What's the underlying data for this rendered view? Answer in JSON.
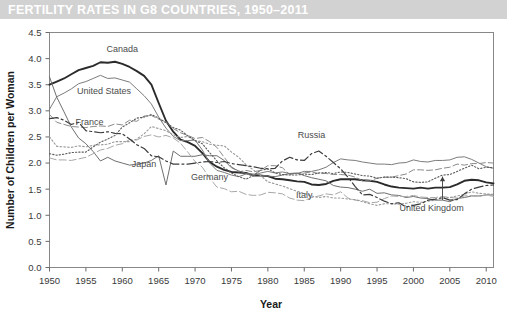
{
  "title": "FERTILITY RATES IN G8 COUNTRIES, 1950–2011",
  "colors": {
    "title_band": "#d2d2d2",
    "title_text": "#ffffff",
    "frame": "#888888",
    "axis_text": "#3a3a3a",
    "label_text": "#4b4b4b"
  },
  "chart_data": {
    "type": "line",
    "title": "FERTILITY RATES IN G8 COUNTRIES, 1950–2011",
    "xlabel": "Year",
    "ylabel": "Number of Children per Woman",
    "xlim": [
      1950,
      2011
    ],
    "ylim": [
      0.0,
      4.5
    ],
    "xticks": [
      1950,
      1955,
      1960,
      1965,
      1970,
      1975,
      1980,
      1985,
      1990,
      1995,
      2000,
      2005,
      2010
    ],
    "yticks": [
      "0.0",
      "0.5",
      "1.0",
      "1.5",
      "2.0",
      "2.5",
      "3.0",
      "3.5",
      "4.0",
      "4.5"
    ],
    "grid": false,
    "legend": "inline-labels",
    "x": [
      1950,
      1951,
      1952,
      1953,
      1954,
      1955,
      1956,
      1957,
      1958,
      1959,
      1960,
      1961,
      1962,
      1963,
      1964,
      1965,
      1966,
      1967,
      1968,
      1969,
      1970,
      1971,
      1972,
      1973,
      1974,
      1975,
      1976,
      1977,
      1978,
      1979,
      1980,
      1981,
      1982,
      1983,
      1984,
      1985,
      1986,
      1987,
      1988,
      1989,
      1990,
      1991,
      1992,
      1993,
      1994,
      1995,
      1996,
      1997,
      1998,
      1999,
      2000,
      2001,
      2002,
      2003,
      2004,
      2005,
      2006,
      2007,
      2008,
      2009,
      2010,
      2011
    ],
    "series": [
      {
        "name": "Canada",
        "label": "Canada",
        "style": "solid-thick-dark",
        "color": "#2b2b2b",
        "width": 1.9,
        "dash": "none",
        "label_xy": [
          1960.0,
          4.12
        ],
        "values": [
          3.5,
          3.56,
          3.62,
          3.7,
          3.78,
          3.82,
          3.86,
          3.93,
          3.92,
          3.94,
          3.9,
          3.84,
          3.76,
          3.67,
          3.5,
          3.15,
          2.81,
          2.6,
          2.45,
          2.4,
          2.33,
          2.19,
          2.02,
          1.93,
          1.87,
          1.83,
          1.82,
          1.81,
          1.76,
          1.76,
          1.75,
          1.7,
          1.69,
          1.67,
          1.65,
          1.64,
          1.59,
          1.58,
          1.6,
          1.66,
          1.69,
          1.69,
          1.69,
          1.67,
          1.66,
          1.64,
          1.59,
          1.55,
          1.53,
          1.52,
          1.51,
          1.53,
          1.51,
          1.53,
          1.53,
          1.54,
          1.59,
          1.66,
          1.68,
          1.67,
          1.63,
          1.61
        ]
      },
      {
        "name": "United States",
        "label": "United States",
        "style": "solid-thin-gray",
        "color": "#7c7c7c",
        "width": 1.0,
        "dash": "none",
        "label_xy": [
          1957.5,
          3.32
        ],
        "values": [
          3.03,
          3.27,
          3.34,
          3.42,
          3.52,
          3.56,
          3.62,
          3.68,
          3.62,
          3.63,
          3.59,
          3.55,
          3.42,
          3.29,
          3.13,
          2.88,
          2.67,
          2.51,
          2.43,
          2.43,
          2.44,
          2.25,
          2.0,
          1.86,
          1.82,
          1.77,
          1.74,
          1.79,
          1.76,
          1.81,
          1.84,
          1.81,
          1.83,
          1.8,
          1.8,
          1.84,
          1.84,
          1.87,
          1.92,
          2.01,
          2.08,
          2.06,
          2.05,
          2.02,
          2.0,
          1.98,
          1.98,
          1.97,
          2.0,
          2.01,
          2.06,
          2.03,
          2.02,
          2.05,
          2.05,
          2.06,
          2.11,
          2.12,
          2.07,
          2.0,
          1.93,
          1.9
        ]
      },
      {
        "name": "France",
        "label": "France",
        "style": "dashed-long-gray",
        "color": "#8a8a8a",
        "width": 1.0,
        "dash": "6,3",
        "label_xy": [
          1955.5,
          2.72
        ],
        "values": [
          2.93,
          2.78,
          2.74,
          2.7,
          2.69,
          2.68,
          2.7,
          2.71,
          2.7,
          2.75,
          2.73,
          2.82,
          2.8,
          2.9,
          2.91,
          2.84,
          2.79,
          2.66,
          2.58,
          2.53,
          2.47,
          2.49,
          2.41,
          2.3,
          2.11,
          1.93,
          1.83,
          1.86,
          1.83,
          1.86,
          1.95,
          1.95,
          1.91,
          1.78,
          1.8,
          1.81,
          1.83,
          1.8,
          1.8,
          1.78,
          1.78,
          1.77,
          1.73,
          1.66,
          1.66,
          1.71,
          1.73,
          1.73,
          1.76,
          1.79,
          1.87,
          1.87,
          1.86,
          1.87,
          1.9,
          1.92,
          1.98,
          1.96,
          1.99,
          1.99,
          2.01,
          2.0
        ]
      },
      {
        "name": "Japan",
        "label": "Japan",
        "style": "solid-thin-gray2",
        "color": "#6f6f6f",
        "width": 1.0,
        "dash": "none",
        "label_xy": [
          1963.0,
          1.92
        ],
        "annotation": "Sharp 1966 dip (Hinoeuma year)",
        "values": [
          3.65,
          3.26,
          2.98,
          2.69,
          2.48,
          2.37,
          2.22,
          2.04,
          2.11,
          2.04,
          2.0,
          1.96,
          1.98,
          2.0,
          2.05,
          2.14,
          1.58,
          2.23,
          2.13,
          2.13,
          2.13,
          2.16,
          2.14,
          2.14,
          2.05,
          1.91,
          1.85,
          1.8,
          1.79,
          1.77,
          1.75,
          1.74,
          1.77,
          1.8,
          1.81,
          1.76,
          1.72,
          1.69,
          1.66,
          1.57,
          1.54,
          1.53,
          1.5,
          1.46,
          1.5,
          1.42,
          1.43,
          1.39,
          1.38,
          1.34,
          1.36,
          1.33,
          1.32,
          1.29,
          1.29,
          1.26,
          1.32,
          1.34,
          1.37,
          1.37,
          1.39,
          1.39
        ]
      },
      {
        "name": "Germany",
        "label": "Germany",
        "style": "dashed-short-lightgray",
        "color": "#a8a8a8",
        "width": 1.0,
        "dash": "7,3",
        "label_xy": [
          1972.0,
          1.68
        ],
        "values": [
          2.1,
          2.06,
          2.06,
          2.05,
          2.08,
          2.11,
          2.18,
          2.25,
          2.28,
          2.34,
          2.37,
          2.45,
          2.44,
          2.51,
          2.54,
          2.5,
          2.53,
          2.48,
          2.38,
          2.21,
          2.03,
          1.92,
          1.71,
          1.54,
          1.51,
          1.45,
          1.46,
          1.4,
          1.38,
          1.39,
          1.44,
          1.43,
          1.41,
          1.33,
          1.29,
          1.28,
          1.34,
          1.37,
          1.41,
          1.39,
          1.45,
          1.33,
          1.29,
          1.28,
          1.24,
          1.25,
          1.32,
          1.37,
          1.36,
          1.36,
          1.38,
          1.35,
          1.34,
          1.34,
          1.36,
          1.34,
          1.33,
          1.37,
          1.38,
          1.36,
          1.39,
          1.36
        ]
      },
      {
        "name": "Italy",
        "label": "Italy",
        "style": "dotted-gray",
        "color": "#9a9a9a",
        "width": 1.1,
        "dash": "1.6,2.2",
        "label_xy": [
          1985.0,
          1.34
        ],
        "values": [
          2.5,
          2.32,
          2.31,
          2.3,
          2.33,
          2.31,
          2.34,
          2.35,
          2.36,
          2.41,
          2.41,
          2.41,
          2.46,
          2.56,
          2.7,
          2.66,
          2.62,
          2.54,
          2.49,
          2.51,
          2.43,
          2.41,
          2.36,
          2.34,
          2.33,
          2.21,
          2.11,
          1.97,
          1.87,
          1.76,
          1.64,
          1.6,
          1.56,
          1.51,
          1.46,
          1.42,
          1.37,
          1.34,
          1.36,
          1.33,
          1.33,
          1.31,
          1.3,
          1.26,
          1.22,
          1.19,
          1.22,
          1.22,
          1.21,
          1.23,
          1.26,
          1.25,
          1.27,
          1.29,
          1.33,
          1.34,
          1.37,
          1.4,
          1.45,
          1.42,
          1.41,
          1.4
        ]
      },
      {
        "name": "Russia",
        "label": "Russia",
        "style": "dash-dot-dark",
        "color": "#3c3c3c",
        "width": 1.2,
        "dash": "9,3,2,3",
        "label_xy": [
          1986.0,
          2.48
        ],
        "values": [
          2.85,
          2.87,
          2.82,
          2.74,
          2.78,
          2.62,
          2.6,
          2.58,
          2.6,
          2.57,
          2.56,
          2.46,
          2.35,
          2.28,
          2.14,
          2.12,
          2.04,
          1.98,
          1.98,
          1.98,
          2.0,
          2.02,
          2.03,
          2.01,
          2.03,
          1.99,
          1.97,
          1.95,
          1.93,
          1.9,
          1.89,
          1.9,
          2.04,
          2.11,
          2.06,
          2.05,
          2.18,
          2.23,
          2.13,
          2.01,
          1.89,
          1.73,
          1.55,
          1.39,
          1.4,
          1.34,
          1.27,
          1.22,
          1.24,
          1.16,
          1.19,
          1.22,
          1.29,
          1.31,
          1.34,
          1.29,
          1.3,
          1.41,
          1.5,
          1.54,
          1.57,
          1.58
        ]
      },
      {
        "name": "United Kingdom",
        "label": "United Kingdom",
        "style": "dotted-fine-dark",
        "color": "#5a5a5a",
        "width": 1.1,
        "dash": "1.3,2.0",
        "label_xy": [
          2002.5,
          1.08
        ],
        "leader_to": [
          2004.0,
          1.74
        ],
        "values": [
          2.18,
          2.15,
          2.17,
          2.2,
          2.21,
          2.21,
          2.31,
          2.4,
          2.46,
          2.53,
          2.69,
          2.77,
          2.86,
          2.88,
          2.93,
          2.86,
          2.77,
          2.68,
          2.63,
          2.52,
          2.43,
          2.37,
          2.2,
          2.04,
          1.91,
          1.81,
          1.74,
          1.69,
          1.76,
          1.86,
          1.89,
          1.81,
          1.78,
          1.77,
          1.77,
          1.79,
          1.78,
          1.81,
          1.82,
          1.8,
          1.83,
          1.82,
          1.79,
          1.76,
          1.75,
          1.71,
          1.73,
          1.73,
          1.72,
          1.7,
          1.64,
          1.63,
          1.64,
          1.71,
          1.77,
          1.78,
          1.84,
          1.9,
          1.96,
          1.89,
          1.92,
          1.91
        ]
      }
    ]
  }
}
